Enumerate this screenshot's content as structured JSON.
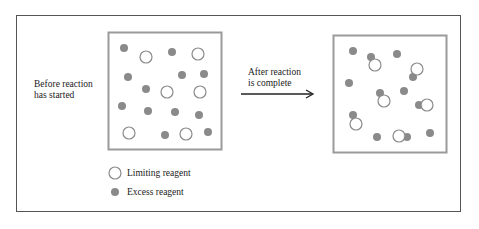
{
  "diagram": {
    "before_label_line1": "Before reaction",
    "before_label_line2": "has started",
    "after_label_line1": "After reaction",
    "after_label_line2": "is complete",
    "legend": {
      "limiting": "Limiting reagent",
      "excess": "Excess reagent"
    },
    "colors": {
      "box_border": "#9a9a9a",
      "excess_fill": "#8a8a8a",
      "limiting_stroke": "#8a8a8a",
      "frame": "#555555",
      "arrow": "#222222"
    },
    "before_box": {
      "excess": [
        [
          124,
          48
        ],
        [
          172,
          52
        ],
        [
          128,
          77
        ],
        [
          182,
          75
        ],
        [
          204,
          74
        ],
        [
          146,
          89
        ],
        [
          122,
          106
        ],
        [
          148,
          111
        ],
        [
          175,
          112
        ],
        [
          199,
          115
        ],
        [
          165,
          135
        ],
        [
          208,
          132
        ]
      ],
      "limiting": [
        [
          146,
          57
        ],
        [
          198,
          54
        ],
        [
          167,
          92
        ],
        [
          200,
          92
        ],
        [
          129,
          133
        ],
        [
          186,
          134
        ]
      ]
    },
    "after_box": {
      "excess": [
        [
          353,
          51
        ],
        [
          371,
          57
        ],
        [
          397,
          54
        ],
        [
          413,
          77
        ],
        [
          349,
          83
        ],
        [
          380,
          93
        ],
        [
          404,
          91
        ],
        [
          419,
          105
        ],
        [
          353,
          115
        ],
        [
          377,
          137
        ],
        [
          407,
          137
        ],
        [
          430,
          133
        ]
      ],
      "limiting": [
        [
          375,
          65
        ],
        [
          417,
          69
        ],
        [
          384,
          101
        ],
        [
          427,
          105
        ],
        [
          356,
          124
        ],
        [
          399,
          136
        ]
      ]
    }
  }
}
